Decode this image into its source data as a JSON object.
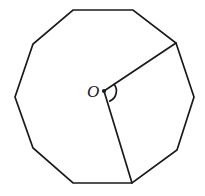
{
  "figure": {
    "shape_name": "nonagon",
    "sides": 9,
    "center_label": "O",
    "stroke_color": "#1a1a1a",
    "background_color": "#ffffff",
    "stroke_width": 1.7,
    "canvas": {
      "width": 205,
      "height": 196
    },
    "center_point": {
      "x": 104,
      "y": 91
    },
    "vertices": [
      {
        "index": 1,
        "x": 73,
        "y": 10
      },
      {
        "index": 2,
        "x": 133,
        "y": 10
      },
      {
        "index": 3,
        "x": 176,
        "y": 43
      },
      {
        "index": 4,
        "x": 194,
        "y": 97
      },
      {
        "index": 5,
        "x": 177,
        "y": 150
      },
      {
        "index": 6,
        "x": 132,
        "y": 183
      },
      {
        "index": 7,
        "x": 73,
        "y": 183
      },
      {
        "index": 8,
        "x": 33,
        "y": 148
      },
      {
        "index": 9,
        "x": 15,
        "y": 97
      },
      {
        "index": 10,
        "x": 33,
        "y": 44
      }
    ],
    "radii": [
      {
        "name": "radius-upper-right",
        "from": {
          "x": 104,
          "y": 91
        },
        "to": {
          "x": 176,
          "y": 43
        }
      },
      {
        "name": "radius-lower-right",
        "from": {
          "x": 104,
          "y": 91
        },
        "to": {
          "x": 132,
          "y": 183
        }
      }
    ],
    "angle_arc": {
      "name": "central-angle-arc",
      "radius_px": 11,
      "path": "M 114.1 84.3 A 11 11 0 0 1 109.8 101.1"
    },
    "center_label_position": {
      "x": 87,
      "y": 83
    }
  }
}
